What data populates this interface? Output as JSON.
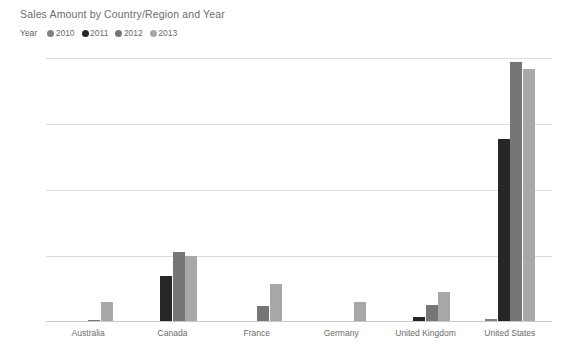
{
  "chart_data": {
    "type": "bar",
    "title": "Sales Amount by Country/Region and Year",
    "xlabel": "",
    "ylabel": "",
    "grid": true,
    "legend_position": "top-left",
    "legend_title": "Year",
    "categories": [
      "Australia",
      "Canada",
      "France",
      "Germany",
      "United Kingdom",
      "United States"
    ],
    "ylim": [
      0,
      20
    ],
    "yticks": [
      0,
      5,
      10,
      15,
      20
    ],
    "ytick_labels": [
      "$0M",
      "$5M",
      "$10M",
      "$15M",
      "$20M"
    ],
    "units": "millions USD",
    "series": [
      {
        "name": "2010",
        "color": "#808080",
        "values": [
          0.0,
          0.0,
          0.0,
          0.0,
          0.0,
          0.2
        ]
      },
      {
        "name": "2011",
        "color": "#262626",
        "values": [
          0.1,
          3.5,
          0.1,
          0.05,
          0.4,
          13.9
        ]
      },
      {
        "name": "2012",
        "color": "#767676",
        "values": [
          0.15,
          5.3,
          1.2,
          0.1,
          1.3,
          19.7
        ]
      },
      {
        "name": "2013",
        "color": "#a8a8a8",
        "values": [
          1.5,
          5.0,
          2.9,
          1.5,
          2.3,
          19.2
        ]
      }
    ]
  },
  "footer": {
    "caption": ""
  },
  "watermark": {
    "text": ""
  }
}
